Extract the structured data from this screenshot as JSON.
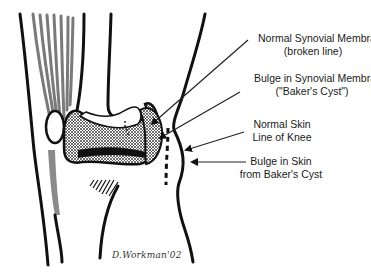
{
  "diagram": {
    "labels": [
      {
        "id": "normal-synovial",
        "line1": "Normal Synovial Membrane",
        "line2": "(broken line)"
      },
      {
        "id": "bulge-synovial",
        "line1": "Bulge in Synovial Membrane",
        "line2": "(\"Baker's Cyst\")"
      },
      {
        "id": "normal-skin",
        "line1": "Normal Skin",
        "line2": "Line of Knee"
      },
      {
        "id": "bulge-skin",
        "line1": "Bulge in Skin",
        "line2": "from Baker's Cyst"
      }
    ],
    "signature": "D.Workman'02",
    "colors": {
      "ink": "#111111",
      "muscle": "#777777",
      "background": "#ffffff"
    }
  }
}
